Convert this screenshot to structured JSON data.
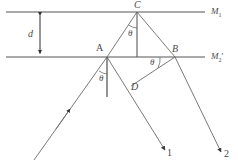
{
  "figure": {
    "type": "optics-ray-diagram",
    "background_color": "#ffffff",
    "line_color": "#555555",
    "text_color": "#4a4a4a"
  },
  "labels": {
    "mirror_top": "M",
    "mirror_top_sub": "1",
    "mirror_bottom": "M",
    "mirror_bottom_sub": "2",
    "mirror_bottom_prime": "′",
    "separation": "d",
    "point_a": "A",
    "point_b": "B",
    "point_c": "C",
    "point_d": "D",
    "angle_at_c": "θ",
    "angle_at_a": "θ",
    "angle_at_b": "θ",
    "ray_one": "1",
    "ray_two": "2"
  },
  "geometry": {
    "mirror_top_y": 12,
    "mirror_bottom_y": 57,
    "mirror_x_start": 6,
    "mirror_x_end": 205,
    "point_a": [
      107,
      57
    ],
    "point_b": [
      175,
      57
    ],
    "point_c": [
      137,
      12
    ],
    "point_d": [
      131,
      86
    ],
    "incident_ray_start": [
      34,
      160
    ],
    "ray_one_end": [
      165,
      150
    ],
    "ray_two_end": [
      221,
      152
    ],
    "normal_a_bottom": [
      107,
      97
    ],
    "normal_c_bottom": [
      137,
      57
    ],
    "d_arrow_x": 40,
    "d_arrow_top": 12,
    "d_arrow_bottom": 57
  }
}
